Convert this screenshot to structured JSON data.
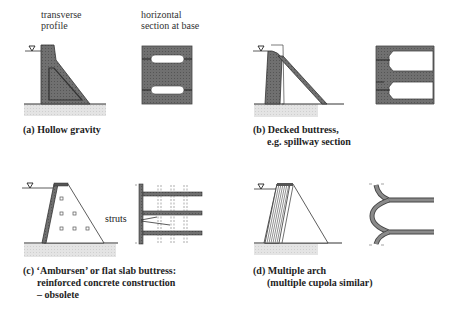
{
  "headers": {
    "transverse": [
      "transverse",
      "profile"
    ],
    "horizontal": [
      "horizontal",
      "section at base"
    ]
  },
  "panels": [
    {
      "id": "a",
      "caption": [
        "(a) Hollow gravity"
      ]
    },
    {
      "id": "b",
      "caption": [
        "(b) Decked buttress,",
        "e.g. spillway section"
      ]
    },
    {
      "id": "c",
      "caption": [
        "(c) ‘Ambursen’ or flat slab buttress:",
        "reinforced concrete construction",
        "– obsolete"
      ],
      "annotation": "struts"
    },
    {
      "id": "d",
      "caption": [
        "(d) Multiple arch",
        "(multiple cupola similar)"
      ]
    }
  ],
  "colors": {
    "fill": "#6a6a6a",
    "line": "#2a2a2a",
    "ground": "#d8d8d8"
  }
}
